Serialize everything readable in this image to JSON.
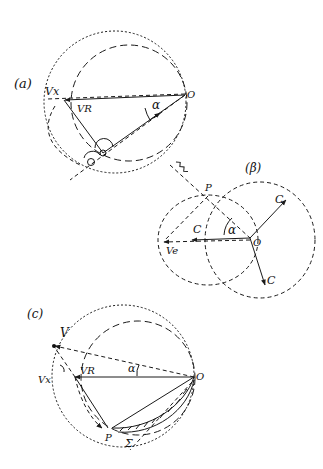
{
  "figure": {
    "panels": [
      {
        "id": "a",
        "label": "(a)",
        "labels": {
          "origin": "O",
          "vx": "Vx",
          "vr": "VR",
          "alpha": "α"
        }
      },
      {
        "id": "b",
        "label": "(β)",
        "labels": {
          "origin": "O",
          "p": "P",
          "c1": "C",
          "c2": "C",
          "c3": "C",
          "ve": "Ve",
          "alpha": "α"
        }
      },
      {
        "id": "c",
        "label": "(c)",
        "labels": {
          "origin": "O",
          "p": "P",
          "v": "V",
          "vx": "Vx",
          "vr": "VR",
          "alpha": "α",
          "sigma": "Σ"
        }
      }
    ]
  }
}
